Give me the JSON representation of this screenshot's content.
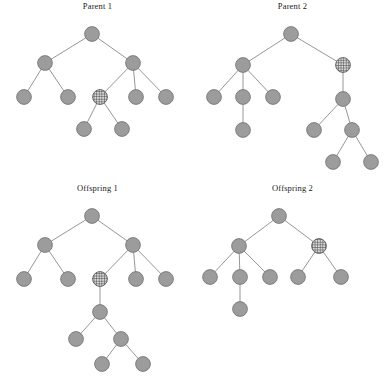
{
  "figure": {
    "caption": "",
    "background_color": "#ffffff",
    "node_fill_color": "#9c9c9c",
    "node_stroke_color": "#6f6f6f",
    "edge_color": "#8a8a8a",
    "hatched_node_pattern": "crosshatch-grid"
  },
  "panels": [
    {
      "id": "parent-1",
      "title": "Parent 1",
      "nodes": [
        {
          "id": "p1-n0",
          "x": 92,
          "y": 34,
          "type": "plain"
        },
        {
          "id": "p1-n1",
          "x": 45,
          "y": 63,
          "type": "plain"
        },
        {
          "id": "p1-n2",
          "x": 133,
          "y": 63,
          "type": "plain"
        },
        {
          "id": "p1-n3",
          "x": 24,
          "y": 97,
          "type": "plain"
        },
        {
          "id": "p1-n4",
          "x": 68,
          "y": 97,
          "type": "plain"
        },
        {
          "id": "p1-n5",
          "x": 100,
          "y": 97,
          "type": "hatched"
        },
        {
          "id": "p1-n6",
          "x": 136,
          "y": 97,
          "type": "plain"
        },
        {
          "id": "p1-n7",
          "x": 166,
          "y": 97,
          "type": "plain"
        },
        {
          "id": "p1-n8",
          "x": 84,
          "y": 129,
          "type": "plain"
        },
        {
          "id": "p1-n9",
          "x": 122,
          "y": 129,
          "type": "plain"
        }
      ],
      "edges": [
        [
          "p1-n0",
          "p1-n1"
        ],
        [
          "p1-n0",
          "p1-n2"
        ],
        [
          "p1-n1",
          "p1-n3"
        ],
        [
          "p1-n1",
          "p1-n4"
        ],
        [
          "p1-n2",
          "p1-n5"
        ],
        [
          "p1-n2",
          "p1-n6"
        ],
        [
          "p1-n2",
          "p1-n7"
        ],
        [
          "p1-n5",
          "p1-n8"
        ],
        [
          "p1-n5",
          "p1-n9"
        ]
      ]
    },
    {
      "id": "parent-2",
      "title": "Parent 2",
      "nodes": [
        {
          "id": "p2-n0",
          "x": 96,
          "y": 34,
          "type": "plain"
        },
        {
          "id": "p2-n1",
          "x": 48,
          "y": 65,
          "type": "plain"
        },
        {
          "id": "p2-n2",
          "x": 148,
          "y": 65,
          "type": "hatched"
        },
        {
          "id": "p2-n3",
          "x": 19,
          "y": 97,
          "type": "plain"
        },
        {
          "id": "p2-n4",
          "x": 48,
          "y": 97,
          "type": "plain"
        },
        {
          "id": "p2-n5",
          "x": 78,
          "y": 97,
          "type": "plain"
        },
        {
          "id": "p2-n6",
          "x": 48,
          "y": 130,
          "type": "plain"
        },
        {
          "id": "p2-n7",
          "x": 148,
          "y": 99,
          "type": "plain"
        },
        {
          "id": "p2-n8",
          "x": 119,
          "y": 130,
          "type": "plain"
        },
        {
          "id": "p2-n9",
          "x": 157,
          "y": 130,
          "type": "plain"
        },
        {
          "id": "p2-n10",
          "x": 138,
          "y": 162,
          "type": "plain"
        },
        {
          "id": "p2-n11",
          "x": 176,
          "y": 162,
          "type": "plain"
        }
      ],
      "edges": [
        [
          "p2-n0",
          "p2-n1"
        ],
        [
          "p2-n0",
          "p2-n2"
        ],
        [
          "p2-n1",
          "p2-n3"
        ],
        [
          "p2-n1",
          "p2-n4"
        ],
        [
          "p2-n1",
          "p2-n5"
        ],
        [
          "p2-n4",
          "p2-n6"
        ],
        [
          "p2-n2",
          "p2-n7"
        ],
        [
          "p2-n7",
          "p2-n8"
        ],
        [
          "p2-n7",
          "p2-n9"
        ],
        [
          "p2-n9",
          "p2-n10"
        ],
        [
          "p2-n9",
          "p2-n11"
        ]
      ]
    },
    {
      "id": "offspring-1",
      "title": "Offspring 1",
      "nodes": [
        {
          "id": "o1-n0",
          "x": 92,
          "y": 34,
          "type": "plain"
        },
        {
          "id": "o1-n1",
          "x": 45,
          "y": 63,
          "type": "plain"
        },
        {
          "id": "o1-n2",
          "x": 133,
          "y": 63,
          "type": "plain"
        },
        {
          "id": "o1-n3",
          "x": 24,
          "y": 97,
          "type": "plain"
        },
        {
          "id": "o1-n4",
          "x": 68,
          "y": 97,
          "type": "plain"
        },
        {
          "id": "o1-n5",
          "x": 100,
          "y": 97,
          "type": "hatched"
        },
        {
          "id": "o1-n6",
          "x": 136,
          "y": 97,
          "type": "plain"
        },
        {
          "id": "o1-n7",
          "x": 166,
          "y": 97,
          "type": "plain"
        },
        {
          "id": "o1-n8",
          "x": 100,
          "y": 130,
          "type": "plain"
        },
        {
          "id": "o1-n9",
          "x": 76,
          "y": 157,
          "type": "plain"
        },
        {
          "id": "o1-n10",
          "x": 121,
          "y": 157,
          "type": "plain"
        },
        {
          "id": "o1-n11",
          "x": 102,
          "y": 182,
          "type": "plain"
        },
        {
          "id": "o1-n12",
          "x": 143,
          "y": 182,
          "type": "plain"
        }
      ],
      "edges": [
        [
          "o1-n0",
          "o1-n1"
        ],
        [
          "o1-n0",
          "o1-n2"
        ],
        [
          "o1-n1",
          "o1-n3"
        ],
        [
          "o1-n1",
          "o1-n4"
        ],
        [
          "o1-n2",
          "o1-n5"
        ],
        [
          "o1-n2",
          "o1-n6"
        ],
        [
          "o1-n2",
          "o1-n7"
        ],
        [
          "o1-n5",
          "o1-n8"
        ],
        [
          "o1-n8",
          "o1-n9"
        ],
        [
          "o1-n8",
          "o1-n10"
        ],
        [
          "o1-n10",
          "o1-n11"
        ],
        [
          "o1-n10",
          "o1-n12"
        ]
      ]
    },
    {
      "id": "offspring-2",
      "title": "Offspring 2",
      "nodes": [
        {
          "id": "o2-n0",
          "x": 84,
          "y": 34,
          "type": "plain"
        },
        {
          "id": "o2-n1",
          "x": 44,
          "y": 64,
          "type": "plain"
        },
        {
          "id": "o2-n2",
          "x": 124,
          "y": 64,
          "type": "hatched"
        },
        {
          "id": "o2-n3",
          "x": 15,
          "y": 95,
          "type": "plain"
        },
        {
          "id": "o2-n4",
          "x": 45,
          "y": 95,
          "type": "plain"
        },
        {
          "id": "o2-n5",
          "x": 75,
          "y": 95,
          "type": "plain"
        },
        {
          "id": "o2-n6",
          "x": 45,
          "y": 127,
          "type": "plain"
        },
        {
          "id": "o2-n7",
          "x": 103,
          "y": 95,
          "type": "plain"
        },
        {
          "id": "o2-n8",
          "x": 146,
          "y": 95,
          "type": "plain"
        }
      ],
      "edges": [
        [
          "o2-n0",
          "o2-n1"
        ],
        [
          "o2-n0",
          "o2-n2"
        ],
        [
          "o2-n1",
          "o2-n3"
        ],
        [
          "o2-n1",
          "o2-n4"
        ],
        [
          "o2-n1",
          "o2-n5"
        ],
        [
          "o2-n4",
          "o2-n6"
        ],
        [
          "o2-n2",
          "o2-n7"
        ],
        [
          "o2-n2",
          "o2-n8"
        ]
      ]
    }
  ]
}
